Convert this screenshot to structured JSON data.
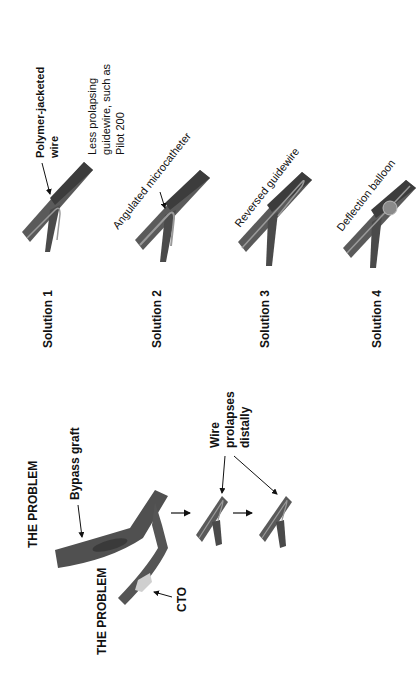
{
  "problem": {
    "title_top": "THE PROBLEM",
    "title_bottom": "THE PROBLEM",
    "bypass_label": "Bypass graft",
    "cto_label": "CTO",
    "wire_label_lines": [
      "Wire",
      "prolapses",
      "distally"
    ]
  },
  "solutions": [
    {
      "label": "Solution 1",
      "annotation_bold": [
        "Polymer-jacketed",
        "wire"
      ],
      "annotation": [
        "Less prolapsing",
        "guidewire, such as",
        "Pilot 200"
      ]
    },
    {
      "label": "Solution 2",
      "annotation": [
        "Angulated microcatheter"
      ]
    },
    {
      "label": "Solution 3",
      "annotation": [
        "Reversed guidewire"
      ]
    },
    {
      "label": "Solution 4",
      "annotation": [
        "Deflection balloon"
      ]
    }
  ],
  "colors": {
    "vessel": "#555555",
    "vessel_dark": "#3a3a3a",
    "wire": "#9a9a9a",
    "cto": "#cfcfcf",
    "balloon": "#8a8a8a"
  }
}
